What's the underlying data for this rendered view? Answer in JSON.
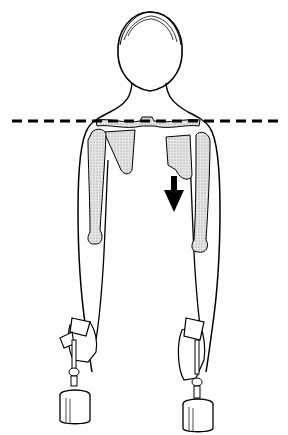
{
  "figure": {
    "title": "",
    "colors": {
      "line": "#000000",
      "bone_fill": "#d9d9d9",
      "background": "#ffffff"
    },
    "elements": {
      "reference_line": "dashed-horizontal-line",
      "arrow": "downward-arrow",
      "weights": [
        "left-weight",
        "right-weight"
      ]
    }
  }
}
